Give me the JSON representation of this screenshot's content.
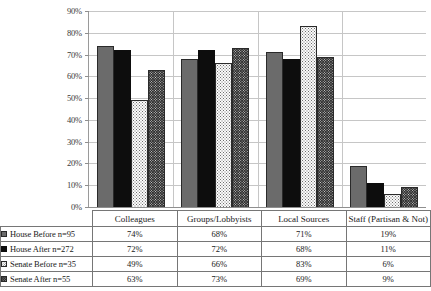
{
  "chart_data": {
    "type": "bar",
    "title": "",
    "xlabel": "",
    "ylabel": "",
    "ylim": [
      0,
      90
    ],
    "grid": true,
    "legend_position": "table-left",
    "ytick_labels": [
      "90%",
      "80%",
      "70%",
      "60%",
      "50%",
      "40%",
      "30%",
      "20%",
      "10%",
      "0%"
    ],
    "ytick_values": [
      90,
      80,
      70,
      60,
      50,
      40,
      30,
      20,
      10,
      0
    ],
    "categories": [
      "Colleagues",
      "Groups/Lobbyists",
      "Local Sources",
      "Staff (Partisan & Not)"
    ],
    "series": [
      {
        "name": "House Before n=95",
        "swatch": "solid-gray",
        "values": [
          74,
          68,
          71,
          19
        ],
        "labels": [
          "74%",
          "68%",
          "71%",
          "19%"
        ]
      },
      {
        "name": "House After n=272",
        "swatch": "solid-black",
        "values": [
          72,
          72,
          68,
          11
        ],
        "labels": [
          "72%",
          "72%",
          "68%",
          "11%"
        ]
      },
      {
        "name": "Senate Before n=35",
        "swatch": "light-dotted",
        "values": [
          49,
          66,
          83,
          6
        ],
        "labels": [
          "49%",
          "66%",
          "83%",
          "6%"
        ]
      },
      {
        "name": "Senate After n=55",
        "swatch": "dark-checkered",
        "values": [
          63,
          73,
          69,
          9
        ],
        "labels": [
          "63%",
          "73%",
          "69%",
          "9%"
        ]
      }
    ],
    "colors": {
      "series_1": "#6b6b6b",
      "series_2": "#0d0d0d",
      "series_3": "#fbfbfb",
      "series_4": "#2e2e2e",
      "gridline": "#c6c6c6",
      "axis": "#8f8f8f",
      "table_border": "#767676"
    }
  }
}
